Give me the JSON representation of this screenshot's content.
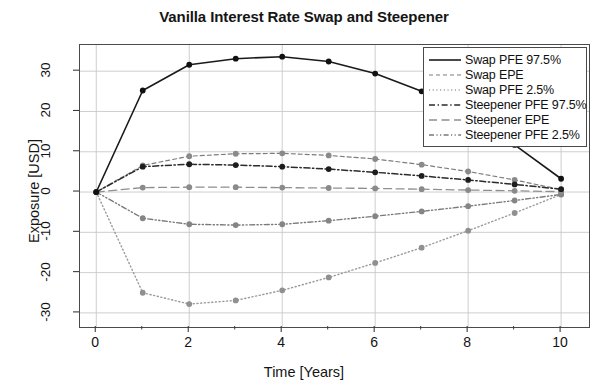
{
  "chart_data": {
    "type": "line",
    "title": "Vanilla Interest Rate Swap and Steepener",
    "xlabel": "Time [Years]",
    "ylabel": "Exposure [USD]",
    "xlim": [
      -0.35,
      10.6
    ],
    "ylim": [
      -33.5,
      36.5
    ],
    "xticks": [
      0,
      2,
      4,
      6,
      8,
      10
    ],
    "xtick_labels": [
      "0",
      "2",
      "4",
      "6",
      "8",
      "10"
    ],
    "xminor_ticks": [
      1,
      3,
      5,
      7,
      9
    ],
    "yticks": [
      -30,
      -20,
      -10,
      0,
      10,
      20,
      30
    ],
    "ytick_labels": [
      "-30",
      "-20",
      "-10",
      "0",
      "10",
      "20",
      "30"
    ],
    "grid": true,
    "grid_color": "#c8c8c8",
    "legend_position": "top-right",
    "markers": "filled-circle",
    "x": [
      0,
      1,
      2,
      3,
      4,
      5,
      6,
      7,
      8,
      9,
      10
    ],
    "series": [
      {
        "name": "Swap PFE 97.5%",
        "style": "solid",
        "color": "#1a1a1a",
        "width": 1.6,
        "marker_color": "#111111",
        "values": [
          0,
          25.2,
          31.6,
          33.1,
          33.6,
          32.4,
          29.4,
          25.0,
          19.2,
          11.7,
          3.3
        ]
      },
      {
        "name": "Swap EPE",
        "style": "dashed-fine",
        "color": "#7d7d7d",
        "width": 1.2,
        "marker_color": "#8a8a8a",
        "values": [
          0,
          6.6,
          8.9,
          9.5,
          9.6,
          9.1,
          8.2,
          6.8,
          5.1,
          3.0,
          0.6
        ]
      },
      {
        "name": "Swap PFE 2.5%",
        "style": "dotted",
        "color": "#9a9a9a",
        "width": 1.4,
        "marker_color": "#909090",
        "values": [
          0,
          -25.0,
          -27.8,
          -26.9,
          -24.4,
          -21.2,
          -17.6,
          -13.8,
          -9.6,
          -5.2,
          -0.6
        ]
      },
      {
        "name": "Steepener PFE 97.5%",
        "style": "dash-dot",
        "color": "#2b2b2b",
        "width": 1.5,
        "marker_color": "#1d1d1d",
        "values": [
          0,
          6.3,
          6.9,
          6.7,
          6.3,
          5.7,
          4.9,
          4.0,
          3.0,
          1.9,
          0.7
        ]
      },
      {
        "name": "Steepener EPE",
        "style": "long-dash",
        "color": "#8f8f8f",
        "width": 1.3,
        "marker_color": "#8a8a8a",
        "values": [
          0,
          1.1,
          1.2,
          1.2,
          1.1,
          1.0,
          0.9,
          0.7,
          0.5,
          0.3,
          0.1
        ]
      },
      {
        "name": "Steepener PFE 2.5%",
        "style": "dash-dot-dot",
        "color": "#7a7a7a",
        "width": 1.4,
        "marker_color": "#858585",
        "values": [
          0,
          -6.5,
          -8.0,
          -8.2,
          -8.0,
          -7.1,
          -6.0,
          -4.8,
          -3.5,
          -2.1,
          -0.6
        ]
      }
    ]
  },
  "legend": {
    "items": [
      {
        "label": "Swap PFE 97.5%"
      },
      {
        "label": "Swap EPE"
      },
      {
        "label": "Swap PFE 2.5%"
      },
      {
        "label": "Steepener PFE 97.5%"
      },
      {
        "label": "Steepener EPE"
      },
      {
        "label": "Steepener PFE 2.5%"
      }
    ]
  }
}
